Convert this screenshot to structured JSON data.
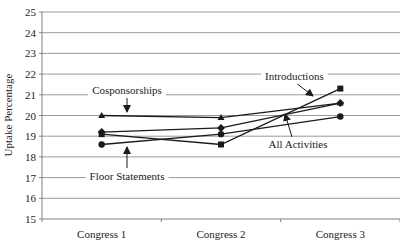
{
  "chart_data": {
    "type": "line",
    "title": "",
    "xlabel": "",
    "ylabel": "Uptake Percentage",
    "categories": [
      "Congress 1",
      "Congress 2",
      "Congress 3"
    ],
    "ylim": [
      15,
      25
    ],
    "yticks": [
      15,
      16,
      17,
      18,
      19,
      20,
      21,
      22,
      23,
      24,
      25
    ],
    "grid": true,
    "legend_position": "inline annotations with arrows",
    "series": [
      {
        "name": "Cosponsorships",
        "marker": "triangle",
        "values": [
          20.0,
          19.9,
          20.6
        ]
      },
      {
        "name": "Introductions",
        "marker": "square",
        "values": [
          19.1,
          18.6,
          21.3
        ]
      },
      {
        "name": "All Activities",
        "marker": "diamond",
        "values": [
          19.2,
          19.4,
          20.6
        ]
      },
      {
        "name": "Floor Statements",
        "marker": "circle",
        "values": [
          18.6,
          19.1,
          19.95
        ]
      }
    ],
    "annotations": [
      {
        "text": "Cosponsorships",
        "x": 127,
        "y": 94,
        "arrow_to": [
          127,
          112
        ]
      },
      {
        "text": "Introductions",
        "x": 265,
        "y": 80,
        "arrow_to": [
          313,
          96
        ]
      },
      {
        "text": "All Activities",
        "x": 298,
        "y": 148,
        "arrow_to": [
          285,
          114
        ]
      },
      {
        "text": "Floor Statements",
        "x": 127,
        "y": 180,
        "arrow_to": [
          127,
          147
        ]
      }
    ]
  },
  "colors": {
    "line": "#1a1a1a",
    "grid": "#9a9a9a",
    "axis": "#808080",
    "text": "#222222"
  }
}
